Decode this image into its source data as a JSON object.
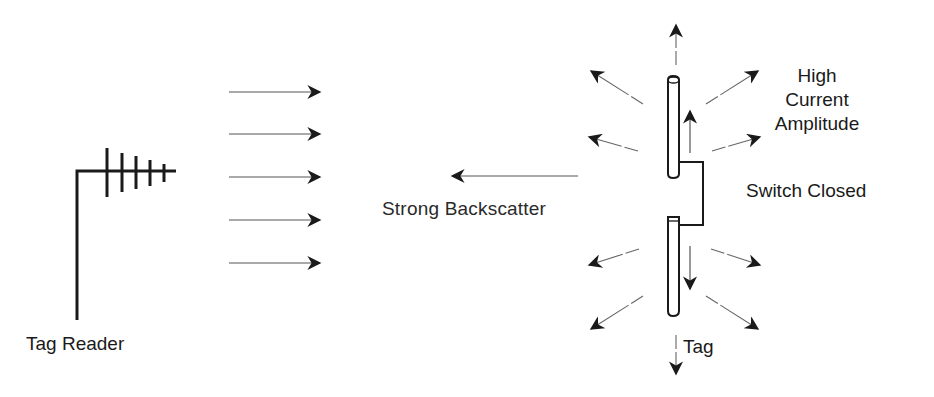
{
  "diagram": {
    "reader": {
      "label": "Tag Reader"
    },
    "incident_wave": {
      "arrow_count": 5,
      "direction": "right"
    },
    "backscatter": {
      "label": "Strong Backscatter",
      "direction": "left"
    },
    "tag": {
      "label": "Tag",
      "current_label_lines": [
        "High",
        "Current",
        "Amplitude"
      ],
      "switch_label": "Switch Closed",
      "switch_state": "closed",
      "radiation_arrow_count": 10
    },
    "colors": {
      "stroke": "#1a1a1a",
      "thin_stroke": "#555555",
      "background": "#ffffff"
    }
  }
}
